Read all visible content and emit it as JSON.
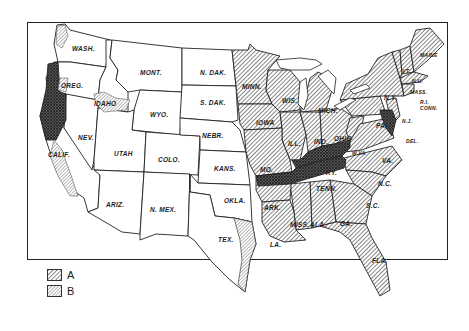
{
  "figure": {
    "title_faint": "CLOVER"
  },
  "colors": {
    "ink": "#222222",
    "hatch_a": "#555555",
    "hatch_b": "#777777",
    "dense_cross": "#333333",
    "paper": "#ffffff"
  },
  "legend": {
    "items": [
      {
        "key": "A",
        "pattern": "diagonal-hatch-coarse"
      },
      {
        "key": "B",
        "pattern": "diagonal-hatch-fine"
      }
    ]
  },
  "states": {
    "wash": "WASH.",
    "oreg": "OREG.",
    "calif": "CALIF.",
    "idaho": "IDAHO",
    "nev": "NEV.",
    "mont": "MONT.",
    "wyo": "WYO.",
    "utah": "UTAH",
    "ariz": "ARIZ.",
    "colo": "COLO.",
    "nmex": "N. MEX.",
    "ndak": "N. DAK.",
    "sdak": "S. DAK.",
    "nebr": "NEBR.",
    "kans": "KANS.",
    "okla": "OKLA.",
    "tex": "TEX.",
    "minn": "MINN.",
    "iowa": "IOWA",
    "mo": "MO.",
    "ark": "ARK.",
    "la": "LA.",
    "wis": "WIS.",
    "ill": "ILL.",
    "mich": "MICH.",
    "ind": "IND.",
    "ohio": "OHIO",
    "ky": "KY.",
    "tenn": "TENN.",
    "miss": "MISS.",
    "ala": "ALA.",
    "ga": "GA.",
    "fla": "FLA.",
    "sc": "S.C.",
    "nc": "N.C.",
    "va": "VA.",
    "wva": "W.VA.",
    "pa": "PA.",
    "ny": "N.Y.",
    "nj": "N.J.",
    "del": "DEL.",
    "md": "MD.",
    "conn": "CONN.",
    "ri": "R.I.",
    "mass": "MASS.",
    "vt": "VT.",
    "nh": "N.H.",
    "maine": "MAINE"
  }
}
